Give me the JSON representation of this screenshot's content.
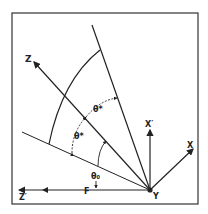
{
  "diagram": {
    "axes": {
      "z": "Z",
      "z_prime": "Z′",
      "x": "X",
      "x_prime": "X′",
      "y": "Y"
    },
    "angles": {
      "theta_star_upper": "θ*",
      "theta_star_lower": "θ*",
      "theta_zero": "θ₀"
    },
    "point_labels": {
      "f": "F"
    },
    "colors": {
      "line": "#222222",
      "frame": "#333333",
      "background": "#ffffff"
    }
  }
}
